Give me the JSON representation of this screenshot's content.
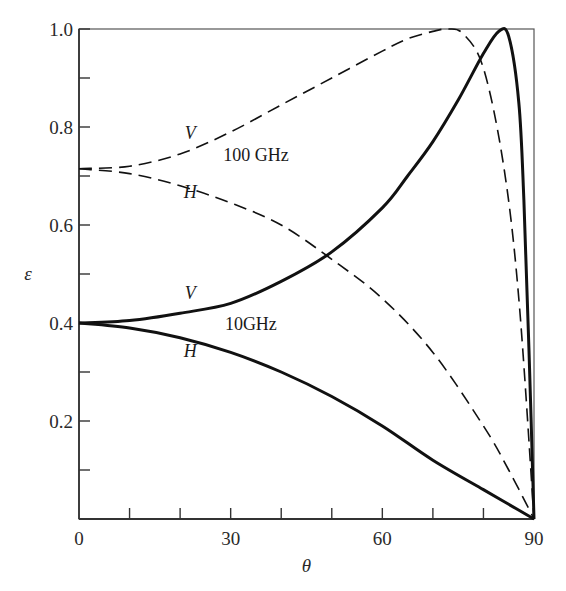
{
  "chart_data": {
    "type": "line",
    "title": "",
    "xlabel": "θ",
    "ylabel": "ε",
    "xlim": [
      0,
      90
    ],
    "ylim": [
      0,
      1.0
    ],
    "grid": false,
    "legend": "none (inline curve labels)",
    "x_ticks": [
      0,
      30,
      60,
      90
    ],
    "x_tick_labels": [
      "0",
      "30",
      "60",
      "90"
    ],
    "x_minor_ticks": [
      10,
      20,
      40,
      50,
      70,
      80
    ],
    "y_ticks": [
      0.2,
      0.4,
      0.6,
      0.8,
      1.0
    ],
    "y_tick_labels": [
      "0.2",
      "0.4",
      "0.6",
      "0.8",
      "1.0"
    ],
    "y_minor_ticks": [
      0.1,
      0.3,
      0.5,
      0.7,
      0.9
    ],
    "series": [
      {
        "name": "10GHz V",
        "style": "solid",
        "x": [
          0,
          10,
          20,
          30,
          40,
          50,
          60,
          65,
          70,
          75,
          80,
          83,
          85,
          87,
          88,
          89,
          90
        ],
        "values": [
          0.4,
          0.405,
          0.42,
          0.44,
          0.485,
          0.545,
          0.635,
          0.7,
          0.77,
          0.855,
          0.95,
          0.995,
          0.985,
          0.85,
          0.65,
          0.35,
          0.0
        ]
      },
      {
        "name": "10GHz H",
        "style": "solid",
        "x": [
          0,
          10,
          20,
          30,
          40,
          50,
          60,
          70,
          80,
          85,
          90
        ],
        "values": [
          0.4,
          0.39,
          0.37,
          0.34,
          0.3,
          0.25,
          0.19,
          0.12,
          0.06,
          0.03,
          0.0
        ]
      },
      {
        "name": "100 GHz V",
        "style": "dashed",
        "x": [
          0,
          10,
          20,
          30,
          40,
          50,
          60,
          65,
          70,
          73,
          76,
          80,
          84,
          87,
          90
        ],
        "values": [
          0.715,
          0.72,
          0.745,
          0.79,
          0.845,
          0.9,
          0.955,
          0.98,
          0.995,
          1.0,
          0.99,
          0.92,
          0.72,
          0.45,
          0.0
        ]
      },
      {
        "name": "100 GHz H",
        "style": "dashed",
        "x": [
          0,
          10,
          20,
          30,
          40,
          50,
          60,
          70,
          80,
          85,
          90
        ],
        "values": [
          0.715,
          0.705,
          0.68,
          0.645,
          0.6,
          0.53,
          0.45,
          0.34,
          0.19,
          0.1,
          0.0
        ]
      }
    ],
    "annotations": [
      {
        "text": "V",
        "near_series": "100 GHz V",
        "x": 22,
        "y": 0.775,
        "italic": true
      },
      {
        "text": "100 GHz",
        "x": 35,
        "y": 0.73,
        "italic": false
      },
      {
        "text": "H",
        "near_series": "100 GHz H",
        "x": 22,
        "y": 0.655,
        "italic": true
      },
      {
        "text": "V",
        "near_series": "10GHz V",
        "x": 22,
        "y": 0.45,
        "italic": true
      },
      {
        "text": "10GHz",
        "x": 34,
        "y": 0.385,
        "italic": false
      },
      {
        "text": "H",
        "near_series": "10GHz H",
        "x": 22,
        "y": 0.33,
        "italic": true
      }
    ]
  },
  "labels": {
    "origin": "0",
    "xaxis": "θ",
    "yaxis": "ε",
    "v": "V",
    "h": "H",
    "freq_high": "100 GHz",
    "freq_low": "10GHz"
  }
}
